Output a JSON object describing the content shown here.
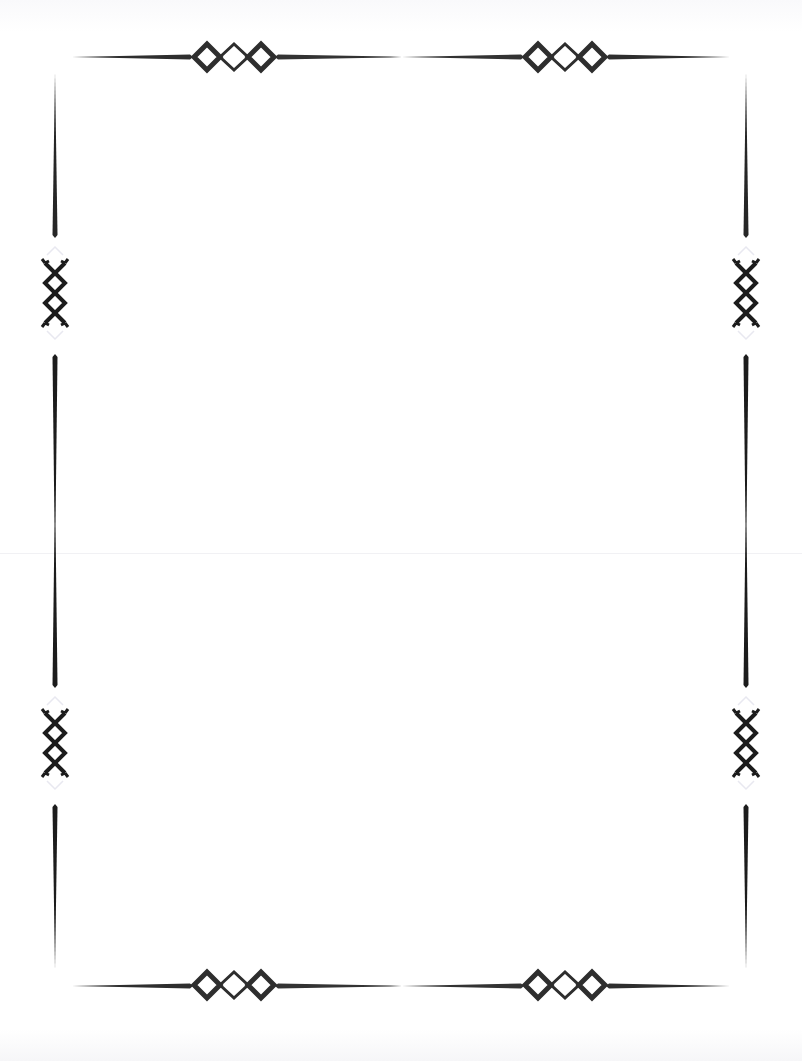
{
  "document": {
    "type": "decorative-page-border",
    "body_text": "",
    "colors": {
      "ornament": "#2e2e2e",
      "page": "#ffffff",
      "edge": "#f4f4f6"
    },
    "ornaments": {
      "top": [
        {
          "name": "diamond-chain-ornament",
          "cx": 234,
          "cy": 57
        },
        {
          "name": "diamond-chain-ornament",
          "cx": 565,
          "cy": 57
        }
      ],
      "bottom": [
        {
          "name": "diamond-chain-ornament",
          "cx": 234,
          "cy": 985
        },
        {
          "name": "diamond-chain-ornament",
          "cx": 565,
          "cy": 985
        }
      ],
      "left": [
        {
          "name": "crossed-diamond-ornament",
          "cx": 55,
          "cy": 295
        },
        {
          "name": "crossed-diamond-ornament",
          "cx": 55,
          "cy": 745
        }
      ],
      "right": [
        {
          "name": "crossed-diamond-ornament",
          "cx": 746,
          "cy": 295
        },
        {
          "name": "crossed-diamond-ornament",
          "cx": 746,
          "cy": 745
        }
      ]
    }
  }
}
